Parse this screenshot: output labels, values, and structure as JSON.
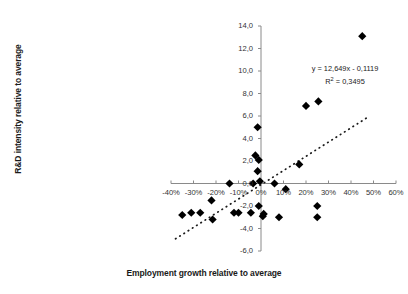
{
  "chart_data": {
    "type": "scatter",
    "title": "",
    "xlabel": "Employment growth relative to average",
    "ylabel": "R&D intensity relative to average",
    "xlim": [
      -40,
      60
    ],
    "ylim": [
      -6.0,
      14.0
    ],
    "xticks": [
      -40,
      -30,
      -20,
      -10,
      0,
      10,
      20,
      30,
      40,
      50,
      60
    ],
    "xtick_labels": [
      "-40%",
      "-30%",
      "-20%",
      "-10%",
      "0%",
      "10%",
      "20%",
      "30%",
      "40%",
      "50%",
      "60%"
    ],
    "yticks": [
      -6.0,
      -4.0,
      -2.0,
      0.0,
      2.0,
      4.0,
      6.0,
      8.0,
      10.0,
      12.0,
      14.0
    ],
    "ytick_labels": [
      "-6,0",
      "-4,0",
      "-2,0",
      "0,0",
      "2,0",
      "4,0",
      "6,0",
      "8,0",
      "10,0",
      "12,0",
      "14,0"
    ],
    "grid": false,
    "legend": null,
    "marker": "diamond",
    "marker_color": "#000000",
    "points": [
      {
        "x": -35.0,
        "y": -2.8
      },
      {
        "x": -31.0,
        "y": -2.6
      },
      {
        "x": -27.0,
        "y": -2.6
      },
      {
        "x": -22.0,
        "y": -1.5
      },
      {
        "x": -21.5,
        "y": -3.2
      },
      {
        "x": -14.0,
        "y": 0.0
      },
      {
        "x": -12.0,
        "y": -2.6
      },
      {
        "x": -10.0,
        "y": -2.6
      },
      {
        "x": -4.5,
        "y": -2.6
      },
      {
        "x": -3.5,
        "y": 0.0
      },
      {
        "x": -2.5,
        "y": 2.5
      },
      {
        "x": -1.0,
        "y": 2.1
      },
      {
        "x": -1.5,
        "y": 1.1
      },
      {
        "x": -0.5,
        "y": 0.2
      },
      {
        "x": -1.5,
        "y": 5.0
      },
      {
        "x": -1.0,
        "y": -2.0
      },
      {
        "x": 0.8,
        "y": -2.9
      },
      {
        "x": 1.2,
        "y": -2.7
      },
      {
        "x": 6.0,
        "y": 0.0
      },
      {
        "x": 8.0,
        "y": -3.0
      },
      {
        "x": 11.0,
        "y": -0.5
      },
      {
        "x": 17.0,
        "y": 1.7
      },
      {
        "x": 20.0,
        "y": 6.9
      },
      {
        "x": 25.5,
        "y": 7.3
      },
      {
        "x": 25.0,
        "y": -2.0
      },
      {
        "x": 25.0,
        "y": -3.0
      },
      {
        "x": 45.0,
        "y": 13.1
      }
    ],
    "trendline": {
      "style": "dotted",
      "slope": 12.649,
      "intercept": -0.1119,
      "x_start": -38.0,
      "x_end": 47.0,
      "equation": "y = 12,649x - 0,1119",
      "r_squared_label": "R",
      "r_squared_sup": "2",
      "r_squared_value": " = 0,3495"
    }
  }
}
